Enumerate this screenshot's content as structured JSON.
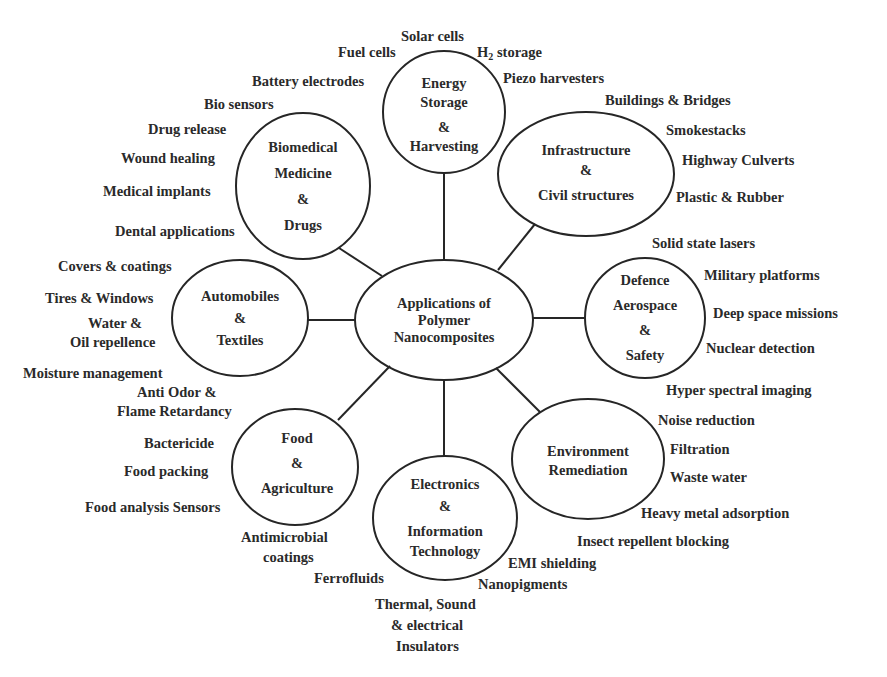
{
  "diagram": {
    "type": "hub-and-spoke mind map",
    "center": {
      "lines": [
        "Applications of",
        "Polymer",
        "Nanocomposites"
      ]
    },
    "nodes": [
      {
        "id": "energy",
        "lines": [
          "Energy",
          "Storage",
          "&",
          "Harvesting"
        ],
        "items": [
          "Solar cells",
          "Fuel cells",
          "H",
          "2",
          " storage",
          "Battery electrodes",
          "Piezo harvesters"
        ]
      },
      {
        "id": "biomedical",
        "lines": [
          "Biomedical",
          "Medicine",
          "&",
          "Drugs"
        ],
        "items": [
          "Bio sensors",
          "Drug release",
          "Wound healing",
          "Medical implants",
          "Dental applications"
        ]
      },
      {
        "id": "infrastructure",
        "lines": [
          "Infrastructure",
          "&",
          "Civil structures"
        ],
        "items": [
          "Buildings & Bridges",
          "Smokestacks",
          "Highway Culverts",
          "Plastic & Rubber"
        ]
      },
      {
        "id": "automobiles",
        "lines": [
          "Automobiles",
          "&",
          "Textiles"
        ],
        "items": [
          "Covers & coatings",
          "Tires & Windows",
          "Water &",
          "Oil repellence",
          "Moisture management",
          "Anti Odor &",
          "Flame Retardancy"
        ]
      },
      {
        "id": "defence",
        "lines": [
          "Defence",
          "Aerospace",
          "&",
          "Safety"
        ],
        "items": [
          "Solid state lasers",
          "Military platforms",
          "Deep space missions",
          "Nuclear detection",
          "Hyper spectral imaging"
        ]
      },
      {
        "id": "food",
        "lines": [
          "Food",
          "&",
          "Agriculture"
        ],
        "items": [
          "Bactericide",
          "Food  packing",
          "Food analysis Sensors",
          "Antimicrobial",
          "coatings"
        ]
      },
      {
        "id": "electronics",
        "lines": [
          "Electronics",
          "&",
          "Information",
          "Technology"
        ],
        "items": [
          "Ferrofluids",
          "EMI shielding",
          "Nanopigments",
          "Thermal, Sound",
          "& electrical",
          "Insulators"
        ]
      },
      {
        "id": "environment",
        "lines": [
          "Environment",
          "Remediation"
        ],
        "items": [
          "Noise reduction",
          "Filtration",
          "Waste water",
          "Heavy metal adsorption",
          "Insect repellent blocking"
        ]
      }
    ],
    "colors": {
      "stroke": "#262626",
      "text": "#2a2a2a",
      "background": "#ffffff"
    }
  }
}
